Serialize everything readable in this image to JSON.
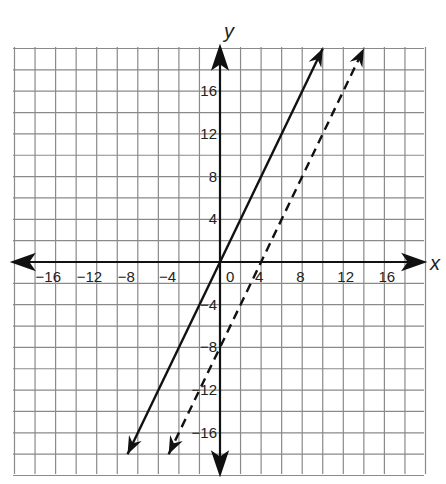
{
  "chart_data": {
    "type": "line",
    "title": "",
    "xlabel": "x",
    "ylabel": "y",
    "xlim": [
      -20,
      20
    ],
    "ylim": [
      -20,
      20
    ],
    "grid": true,
    "grid_step": 2,
    "x_ticks": [
      "-16",
      "-12",
      "-8",
      "-4",
      "0",
      "4",
      "8",
      "12",
      "16"
    ],
    "y_ticks": [
      "16",
      "12",
      "8",
      "4",
      "-4",
      "-8",
      "-12",
      "-16"
    ],
    "series": [
      {
        "name": "solid line",
        "style": "solid",
        "equation": "y = 2x",
        "x": [
          -9,
          10
        ],
        "y": [
          -18,
          20
        ]
      },
      {
        "name": "dashed line",
        "style": "dashed",
        "equation": "y = 2x - 8",
        "x": [
          -5,
          14
        ],
        "y": [
          -18,
          20
        ]
      }
    ]
  },
  "labels": {
    "x_axis": "x",
    "y_axis": "y",
    "x_ticks": [
      {
        "text": "−16",
        "v": -16
      },
      {
        "text": "−12",
        "v": -12
      },
      {
        "text": "−8",
        "v": -8
      },
      {
        "text": "−4",
        "v": -4
      },
      {
        "text": "0",
        "v": 0
      },
      {
        "text": "4",
        "v": 4
      },
      {
        "text": "8",
        "v": 8
      },
      {
        "text": "12",
        "v": 12
      },
      {
        "text": "16",
        "v": 16
      }
    ],
    "y_ticks": [
      {
        "text": "16",
        "v": 16
      },
      {
        "text": "12",
        "v": 12
      },
      {
        "text": "8",
        "v": 8
      },
      {
        "text": "4",
        "v": 4
      },
      {
        "text": "−4",
        "v": -4
      },
      {
        "text": "−8",
        "v": -8
      },
      {
        "text": "−12",
        "v": -12
      },
      {
        "text": "−16",
        "v": -16
      }
    ]
  }
}
